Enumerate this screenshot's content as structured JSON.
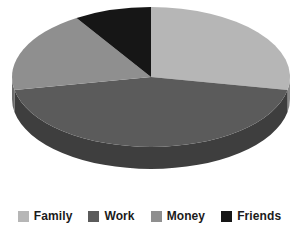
{
  "chart_data": {
    "type": "pie",
    "title": "",
    "subtitle": "",
    "xlabel": "",
    "ylabel": "",
    "grid": false,
    "three_d": true,
    "legend_position": "bottom",
    "categories": [
      "Family",
      "Work",
      "Money",
      "Friends"
    ],
    "values": [
      28,
      44,
      19,
      9
    ],
    "units": "percent",
    "colors": [
      "#b6b6b6",
      "#5b5b5b",
      "#8f8f8f",
      "#161616"
    ],
    "side_colors": [
      "#8a8a8a",
      "#3e3e3e",
      "#6c6c6c",
      "#0c0c0c"
    ],
    "slices": [
      {
        "label": "Family",
        "value": 28,
        "color": "#b6b6b6",
        "side_color": "#8a8a8a",
        "start_deg": 0,
        "end_deg": 100.8
      },
      {
        "label": "Work",
        "value": 44,
        "color": "#5b5b5b",
        "side_color": "#3e3e3e",
        "start_deg": 100.8,
        "end_deg": 259.2
      },
      {
        "label": "Money",
        "value": 19,
        "color": "#8f8f8f",
        "side_color": "#6c6c6c",
        "start_deg": 259.2,
        "end_deg": 327.6
      },
      {
        "label": "Friends",
        "value": 9,
        "color": "#161616",
        "side_color": "#0c0c0c",
        "start_deg": 327.6,
        "end_deg": 360
      }
    ],
    "geometry": {
      "center_x": 151,
      "center_y": 77,
      "radius_x": 139,
      "radius_y": 70,
      "depth": 22
    },
    "background": "#ffffff"
  },
  "legend": {
    "items": [
      {
        "label": "Family",
        "color": "#b6b6b6"
      },
      {
        "label": "Work",
        "color": "#5b5b5b"
      },
      {
        "label": "Money",
        "color": "#8f8f8f"
      },
      {
        "label": "Friends",
        "color": "#161616"
      }
    ]
  }
}
